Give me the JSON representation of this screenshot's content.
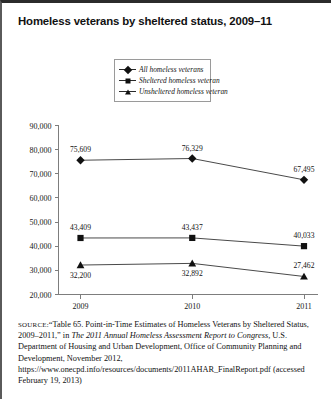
{
  "title": "Homeless veterans by sheltered status, 2009–11",
  "legend": {
    "items": [
      {
        "label": "All homeless veterans",
        "marker": "diamond-marker"
      },
      {
        "label": "Sheltered homeless veteran",
        "marker": "square-marker"
      },
      {
        "label": "Unsheltered homeless veteran",
        "marker": "triangle-marker"
      }
    ]
  },
  "source": {
    "prefix": "SOURCE:",
    "text_1": "“Table 65. Point-in-Time Estimates of Homeless Veterans by Sheltered Status, 2009–2011,” in ",
    "italic_1": "The 2011 Annual Homeless Assessment Report to Congress,",
    "text_2": " U.S. Department of Housing and Urban Development, Office of Community Planning and Development, November 2012, https://www.onecpd.info/resources/documents/2011AHAR_FinalReport.pdf (accessed February 19, 2013)"
  },
  "chart_data": {
    "type": "line",
    "title": "Homeless veterans by sheltered status, 2009–11",
    "xlabel": "",
    "ylabel": "",
    "categories": [
      "2009",
      "2010",
      "2011"
    ],
    "ylim": [
      20000,
      90000
    ],
    "yticks": [
      20000,
      30000,
      40000,
      50000,
      60000,
      70000,
      80000,
      90000
    ],
    "ytick_labels": [
      "20,000",
      "30,000",
      "40,000",
      "50,000",
      "60,000",
      "70,000",
      "80,000",
      "90,000"
    ],
    "grid": false,
    "legend_position": "top-center",
    "series": [
      {
        "name": "All homeless veterans",
        "marker": "diamond",
        "values": [
          75609,
          76329,
          67495
        ],
        "data_labels": [
          "75,609",
          "76,329",
          "67,495"
        ],
        "label_positions": [
          "above",
          "above",
          "above"
        ]
      },
      {
        "name": "Sheltered homeless veteran",
        "marker": "square",
        "values": [
          43409,
          43437,
          40033
        ],
        "data_labels": [
          "43,409",
          "43,437",
          "40,033"
        ],
        "label_positions": [
          "above",
          "above",
          "above"
        ]
      },
      {
        "name": "Unsheltered homeless veteran",
        "marker": "triangle",
        "values": [
          32200,
          32892,
          27462
        ],
        "data_labels": [
          "32,200",
          "32,892",
          "27,462"
        ],
        "label_positions": [
          "below",
          "below",
          "above"
        ]
      }
    ]
  }
}
